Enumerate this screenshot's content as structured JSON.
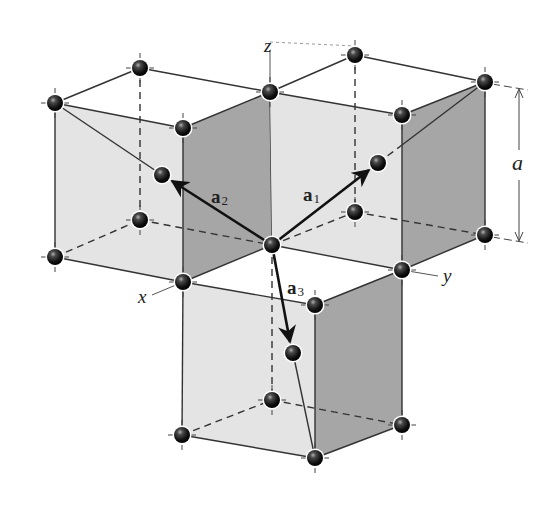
{
  "figure": {
    "colors": {
      "background": "#ffffff",
      "face_light": "#e6e6e6",
      "face_dark": "#a9a9a9",
      "edge": "#333333",
      "atom": "#111111",
      "atom_highlight": "#9a9a9a",
      "vector": "#111111"
    },
    "axes": {
      "x": "x",
      "y": "y",
      "z": "z"
    },
    "vectors": [
      {
        "name": "a",
        "subscript": "1"
      },
      {
        "name": "a",
        "subscript": "2"
      },
      {
        "name": "a",
        "subscript": "3"
      }
    ],
    "dimension": {
      "label": "a"
    },
    "atoms": [
      {
        "id": "left-top-back",
        "x": 140,
        "y": 68
      },
      {
        "id": "left-top-left",
        "x": 55,
        "y": 103
      },
      {
        "id": "left-top-front",
        "x": 183,
        "y": 128
      },
      {
        "id": "shared-top",
        "x": 270,
        "y": 92
      },
      {
        "id": "left-bottom-left",
        "x": 55,
        "y": 257
      },
      {
        "id": "left-bottom-back",
        "x": 140,
        "y": 220
      },
      {
        "id": "left-bottom-front",
        "x": 183,
        "y": 282
      },
      {
        "id": "left-body-center",
        "x": 162,
        "y": 175
      },
      {
        "id": "right-top-back",
        "x": 355,
        "y": 55
      },
      {
        "id": "right-top-right",
        "x": 485,
        "y": 82
      },
      {
        "id": "right-top-front",
        "x": 402,
        "y": 115
      },
      {
        "id": "right-bottom-back",
        "x": 355,
        "y": 212
      },
      {
        "id": "right-bottom-right",
        "x": 485,
        "y": 235
      },
      {
        "id": "right-bottom-front",
        "x": 402,
        "y": 270
      },
      {
        "id": "right-body-center",
        "x": 378,
        "y": 163
      },
      {
        "id": "origin",
        "x": 272,
        "y": 245
      },
      {
        "id": "lower-top-right",
        "x": 315,
        "y": 305
      },
      {
        "id": "lower-body-center",
        "x": 293,
        "y": 353
      },
      {
        "id": "lower-bottom-back",
        "x": 272,
        "y": 400
      },
      {
        "id": "lower-bottom-left",
        "x": 182,
        "y": 435
      },
      {
        "id": "lower-bottom-right",
        "x": 402,
        "y": 425
      },
      {
        "id": "lower-bottom-front",
        "x": 315,
        "y": 458
      }
    ]
  }
}
